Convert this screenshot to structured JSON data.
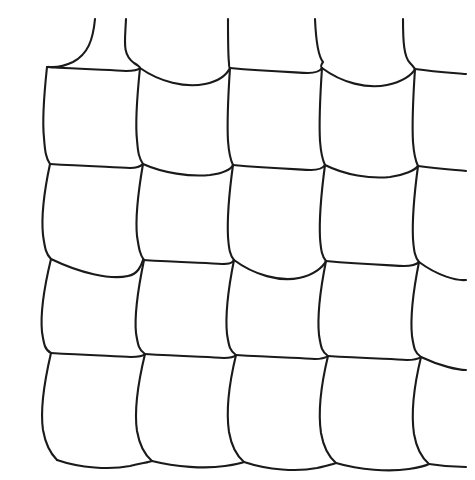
{
  "figure": {
    "background_color": "#ffffff",
    "stroke_color": "#1a1a1a",
    "stroke_width": 2.1,
    "canvas": {
      "width": 475,
      "height": 480
    },
    "grid": {
      "columns": 5,
      "rows": 4,
      "node_columns_x": [
        47,
        140,
        230,
        322,
        415
      ],
      "node_rows_y": [
        67,
        164,
        259,
        353,
        450
      ],
      "cell_count": 20
    },
    "strands": {
      "vertical_count": 5,
      "horizontal_count": 5,
      "top_overhang_y": 19,
      "right_overhang_x": 466,
      "bottom_sag_y": 466
    }
  },
  "paths": {
    "vertical": [
      "M 95 19 C 93 40 88 54 73 62 C 56 70 48 66 47 67",
      "M 47 67 C 44 95 42 120 44 138 C 45 152 46 158 50 164",
      "M 50 164 C 44 192 41 215 43 235 C 45 249 46 254 51 259",
      "M 51 259 C 44 288 40 312 42 332 C 44 345 45 350 51 353",
      "M 51 353 C 44 383 40 410 43 430 C 46 447 52 455 57 460",
      "M 126 19 C 125 42 122 54 134 63 C 142 68 139 67 140 68",
      "M 140 68 C 137 97 135 122 137 140 C 138 153 139 158 143 164",
      "M 143 164 C 138 193 135 216 137 236 C 139 249 140 255 144 260",
      "M 144 260 C 138 289 134 313 136 333 C 138 346 139 350 145 354",
      "M 145 354 C 138 383 134 411 137 431 C 140 448 146 456 152 461",
      "M 228 19 C 228 40 228 55 229 63 C 229 67 229 67 230 68",
      "M 230 68 C 228 98 227 123 228 141 C 229 154 230 159 233 165",
      "M 233 165 C 229 194 227 217 228 237 C 229 250 230 255 234 260",
      "M 234 260 C 228 290 225 314 227 334 C 229 347 230 351 236 355",
      "M 236 355 C 229 384 226 412 229 432 C 232 449 238 457 244 462",
      "M 315 19 C 316 42 318 56 323 62 C 320 66 321 67 322 68",
      "M 322 68 C 320 98 319 123 320 141 C 321 154 322 159 325 165",
      "M 325 165 C 321 195 319 218 320 238 C 321 251 322 256 326 261",
      "M 326 261 C 320 291 317 315 319 335 C 321 348 322 352 328 356",
      "M 328 356 C 321 385 318 413 321 433 C 324 450 330 458 336 463",
      "M 403 19 C 403 42 404 57 410 63 C 414 67 414 68 415 69",
      "M 415 69 C 413 99 412 124 413 142 C 414 155 415 160 418 166",
      "M 418 166 C 414 196 412 219 413 239 C 414 252 415 257 419 262",
      "M 419 262 C 413 292 410 316 412 336 C 414 349 415 353 421 357",
      "M 421 357 C 414 386 411 414 414 434 C 417 451 423 459 429 464"
    ],
    "horizontal": [
      "M 47 67 C 80 69 108 70 126 71 C 134 71 138 70 140 68",
      "M 140 68 C 160 82 185 88 205 84 C 220 81 227 74 230 68",
      "M 230 68 C 262 71 290 72 308 73 C 316 73 320 71 322 68",
      "M 322 68 C 342 83 367 89 387 85 C 402 82 412 75 415 69",
      "M 415 69 C 436 72 455 73 466 74",
      "M 50 164 C 83 166 112 167 130 168 C 138 168 141 166 143 164",
      "M 143 164 C 163 173 190 177 210 175 C 225 173 231 169 233 165",
      "M 233 165 C 265 168 293 169 311 170 C 319 170 323 168 325 165",
      "M 325 165 C 345 175 370 179 390 177 C 405 175 415 170 418 166",
      "M 418 166 C 439 169 457 170 466 171",
      "M 51 259 C 80 273 110 280 128 276 C 138 274 141 266 143 260",
      "M 143 260 C 176 262 204 263 222 264 C 230 264 232 263 234 260",
      "M 234 260 C 254 275 280 282 299 278 C 314 275 323 267 326 261",
      "M 326 261 C 358 264 386 265 404 266 C 412 266 416 265 419 262",
      "M 419 262 C 438 276 457 281 466 280",
      "M 51 353 C 84 355 113 356 131 357 C 139 357 143 356 145 354",
      "M 145 354 C 178 356 206 357 224 358 C 232 358 234 357 236 355",
      "M 236 355 C 269 357 297 358 315 359 C 323 359 325 358 328 356",
      "M 328 356 C 361 358 389 359 407 360 C 415 360 418 359 421 357",
      "M 421 357 C 440 366 458 370 466 370",
      "M 57 460 C 80 468 110 470 130 466 C 143 463 150 462 152 461",
      "M 152 461 C 176 467 205 469 225 466 C 238 464 242 463 244 462",
      "M 244 462 C 268 470 297 472 317 468 C 330 465 334 464 336 463",
      "M 336 463 C 360 470 389 472 409 469 C 422 467 427 465 429 464",
      "M 429 464 C 447 467 460 467 466 467"
    ]
  }
}
